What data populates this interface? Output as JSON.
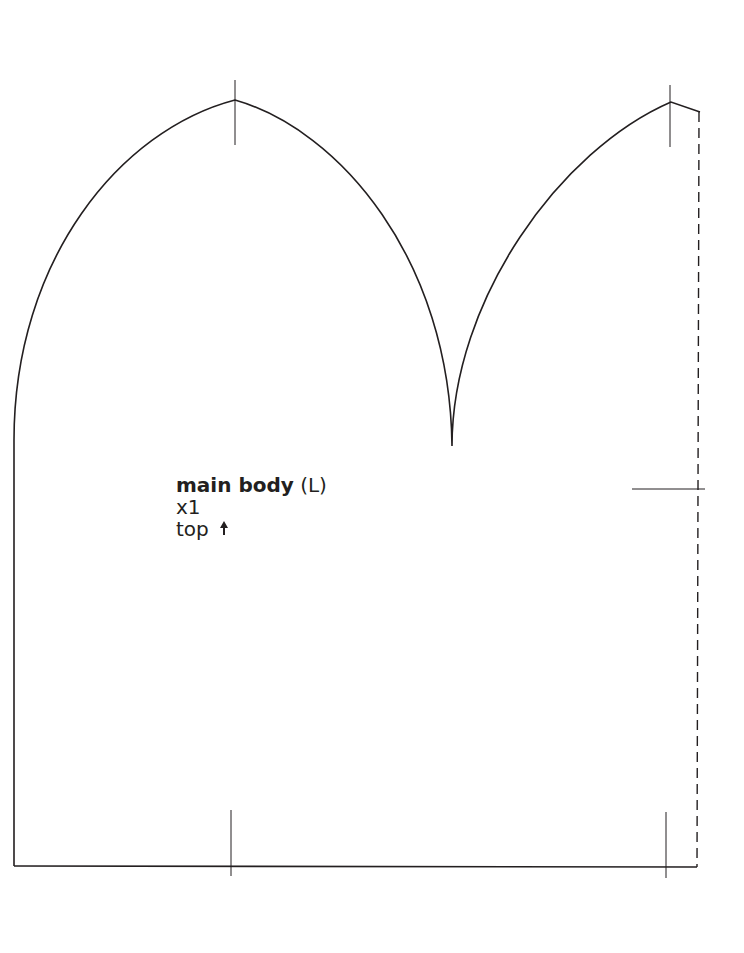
{
  "pattern": {
    "piece_name": "main body",
    "side": "(L)",
    "quantity": "x1",
    "orientation": "top",
    "orientation_icon": "arrow-up-icon",
    "line_color": "#231f20",
    "edges": {
      "outline": "solid",
      "fold_or_seam": "dashed"
    }
  }
}
